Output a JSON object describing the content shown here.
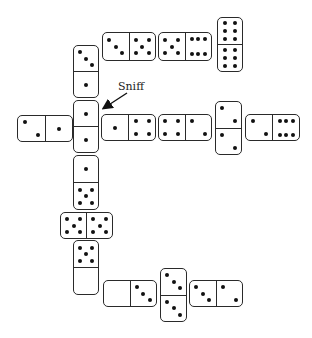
{
  "annotation": {
    "label": "Sniff",
    "target_domino": 6
  },
  "dominoes": [
    {
      "id": 1,
      "orientation": "v",
      "x": 73,
      "y": 45,
      "w": 26,
      "h": 53,
      "ends": [
        3,
        1
      ]
    },
    {
      "id": 2,
      "orientation": "h",
      "x": 102,
      "y": 32,
      "w": 54,
      "h": 29,
      "ends": [
        3,
        5
      ]
    },
    {
      "id": 3,
      "orientation": "h",
      "x": 158,
      "y": 32,
      "w": 54,
      "h": 29,
      "ends": [
        5,
        6
      ]
    },
    {
      "id": 4,
      "orientation": "v",
      "x": 217,
      "y": 17,
      "w": 26,
      "h": 55,
      "ends": [
        6,
        6
      ]
    },
    {
      "id": 5,
      "orientation": "h",
      "x": 17,
      "y": 115,
      "w": 56,
      "h": 27,
      "ends": [
        2,
        1
      ]
    },
    {
      "id": 6,
      "orientation": "v",
      "x": 73,
      "y": 100,
      "w": 26,
      "h": 53,
      "ends": [
        1,
        1
      ]
    },
    {
      "id": 7,
      "orientation": "h",
      "x": 101,
      "y": 114,
      "w": 55,
      "h": 27,
      "ends": [
        1,
        4
      ]
    },
    {
      "id": 8,
      "orientation": "h",
      "x": 158,
      "y": 114,
      "w": 54,
      "h": 27,
      "ends": [
        4,
        2
      ]
    },
    {
      "id": 9,
      "orientation": "v",
      "x": 215,
      "y": 101,
      "w": 27,
      "h": 54,
      "ends": [
        2,
        2
      ]
    },
    {
      "id": 10,
      "orientation": "h",
      "x": 245,
      "y": 114,
      "w": 55,
      "h": 27,
      "ends": [
        2,
        6
      ]
    },
    {
      "id": 11,
      "orientation": "v",
      "x": 73,
      "y": 155,
      "w": 26,
      "h": 55,
      "ends": [
        1,
        5
      ]
    },
    {
      "id": 12,
      "orientation": "h",
      "x": 60,
      "y": 212,
      "w": 53,
      "h": 27,
      "ends": [
        5,
        5
      ]
    },
    {
      "id": 13,
      "orientation": "v",
      "x": 73,
      "y": 240,
      "w": 26,
      "h": 55,
      "ends": [
        5,
        0
      ]
    },
    {
      "id": 14,
      "orientation": "h",
      "x": 103,
      "y": 280,
      "w": 54,
      "h": 27,
      "ends": [
        0,
        3
      ]
    },
    {
      "id": 15,
      "orientation": "v",
      "x": 160,
      "y": 268,
      "w": 27,
      "h": 54,
      "ends": [
        3,
        3
      ]
    },
    {
      "id": 16,
      "orientation": "h",
      "x": 189,
      "y": 280,
      "w": 54,
      "h": 27,
      "ends": [
        3,
        2
      ]
    }
  ],
  "colors": {
    "outline": "#2a2a2a",
    "pip": "#111111",
    "background": "#ffffff"
  }
}
